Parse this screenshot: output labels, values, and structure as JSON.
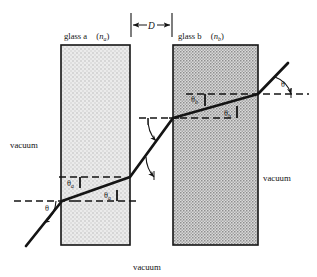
{
  "figure": {
    "title_visible": false,
    "type": "optics-refraction-diagram",
    "background_color": "#ffffff",
    "ink_color": "#141414"
  },
  "slabs": [
    {
      "id": "glass-a",
      "label_main": "glass a",
      "label_index_open": "(",
      "label_index_symbol": "n",
      "label_index_sub": "a",
      "label_index_close": ")",
      "fill_color": "#e3e3e3",
      "stipple": "light",
      "x": 61,
      "y": 45,
      "width": 69,
      "height": 200
    },
    {
      "id": "glass-b",
      "label_main": "glass b",
      "label_index_open": "(",
      "label_index_symbol": "n",
      "label_index_sub": "b",
      "label_index_close": ")",
      "fill_color": "#cfcfcf",
      "stipple": "dense",
      "x": 173,
      "y": 45,
      "width": 85,
      "height": 200
    }
  ],
  "dimension": {
    "label": "D",
    "description": "gap width between slab a and slab b",
    "x_start": 131,
    "x_end": 172,
    "y": 25
  },
  "vacuum_labels": [
    {
      "id": "vacuum-left",
      "text": "vacuum",
      "x": 10,
      "y": 145
    },
    {
      "id": "vacuum-right",
      "text": "vacuum",
      "x": 265,
      "y": 178
    },
    {
      "id": "vacuum-bottom",
      "text": "vacuum",
      "x": 133,
      "y": 268
    }
  ],
  "angles": [
    {
      "id": "theta-incident",
      "symbol": "θ",
      "sub": "",
      "x": 44,
      "y": 208
    },
    {
      "id": "theta-a-upper",
      "symbol": "θ",
      "sub": "a",
      "x": 68,
      "y": 184
    },
    {
      "id": "theta-a-lower",
      "symbol": "θ",
      "sub": "a",
      "x": 106,
      "y": 196
    },
    {
      "id": "theta-b-upper",
      "symbol": "θ",
      "sub": "b",
      "x": 192,
      "y": 100
    },
    {
      "id": "theta-b-lower",
      "symbol": "θ",
      "sub": "b",
      "x": 226,
      "y": 114
    },
    {
      "id": "theta-exit",
      "symbol": "θ",
      "sub": "",
      "x": 283,
      "y": 84
    }
  ],
  "ray": {
    "description": "light ray refracting through two glass slabs separated by a vacuum gap",
    "points": [
      {
        "x": 26,
        "y": 246,
        "note": "incident ray start, lower left in vacuum"
      },
      {
        "x": 62,
        "y": 201,
        "note": "enters glass a at left face"
      },
      {
        "x": 130,
        "y": 177,
        "note": "exits glass a at right face"
      },
      {
        "x": 173,
        "y": 118,
        "note": "enters glass b at left face"
      },
      {
        "x": 258,
        "y": 94,
        "note": "exits glass b at right face"
      },
      {
        "x": 288,
        "y": 63,
        "note": "outgoing ray end, upper right in vacuum"
      }
    ],
    "stroke_width": 2.6
  },
  "reference_lines": [
    {
      "id": "dash-incident",
      "x1": 14,
      "x2": 74,
      "y": 201
    },
    {
      "id": "dash-a-exit-1",
      "x1": 59,
      "x2": 122,
      "y": 177
    },
    {
      "id": "dash-a-exit-2",
      "x1": 74,
      "x2": 138,
      "y": 201
    },
    {
      "id": "dash-a-exit-out",
      "x1": 125,
      "x2": 152,
      "y": 177
    },
    {
      "id": "dash-gap-top",
      "x1": 139,
      "x2": 178,
      "y": 118
    },
    {
      "id": "dash-b-entry",
      "x1": 169,
      "x2": 232,
      "y": 118
    },
    {
      "id": "dash-b-inner",
      "x1": 186,
      "x2": 248,
      "y": 94
    },
    {
      "id": "dash-exit",
      "x1": 251,
      "x2": 307,
      "y": 94
    }
  ]
}
